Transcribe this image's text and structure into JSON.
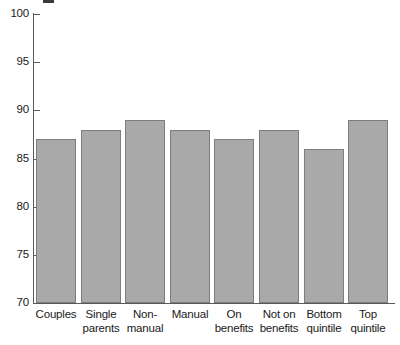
{
  "chart_data": {
    "type": "bar",
    "title": "",
    "subtitle": "",
    "xlabel": "",
    "ylabel": "",
    "ylim": [
      70,
      100
    ],
    "ytick_values": [
      100,
      95,
      90,
      85,
      80,
      75,
      70
    ],
    "ytick_labels": [
      "100",
      "95",
      "90",
      "85",
      "80",
      "75",
      "70"
    ],
    "grid": false,
    "legend": false,
    "legend_position": "none",
    "categories": [
      "Couples",
      "Single parents",
      "Non-manual",
      "Manual",
      "On benefits",
      "Not on benefits",
      "Bottom quintile",
      "Top quintile"
    ],
    "category_label_lines": [
      [
        "Couples"
      ],
      [
        "Single",
        "parents"
      ],
      [
        "Non-",
        "manual"
      ],
      [
        "Manual"
      ],
      [
        "On",
        "benefits"
      ],
      [
        "Not on",
        "benefits"
      ],
      [
        "Bottom",
        "quintile"
      ],
      [
        "Top",
        "quintile"
      ]
    ],
    "values": [
      87,
      88,
      89,
      88,
      87,
      88,
      86,
      89
    ],
    "bar_fill_color": "#a9a9a9",
    "bar_edge_color": "#7d7d7d",
    "axis_color": "#5a5a5a",
    "text_color": "#1a1a1a",
    "background_color": "#ffffff"
  }
}
